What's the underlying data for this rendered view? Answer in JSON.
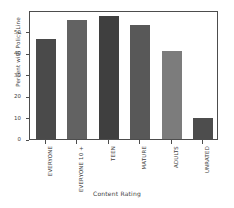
{
  "chart_data": {
    "type": "bar",
    "title": "",
    "xlabel": "Content Rating",
    "ylabel": "Percent with Policy Line",
    "categories": [
      "EVERYONE",
      "EVERYONE 10 +",
      "TEEN",
      "MATURE",
      "ADULTS",
      "UNRATED"
    ],
    "values": [
      46.5,
      55.5,
      57.0,
      53.0,
      41.0,
      9.8
    ],
    "bar_colors": [
      "#4a4a4a",
      "#626262",
      "#3f3f3f",
      "#585858",
      "#7c7c7c",
      "#4d4d4d"
    ],
    "ylim": [
      0,
      60
    ],
    "yticks": [
      0,
      10,
      20,
      30,
      40,
      50
    ],
    "ytick_labels": [
      "0",
      "10",
      "20",
      "30",
      "40",
      "50"
    ],
    "grid": false,
    "legend": null,
    "axis_color": "#4d4d4d",
    "background": "#ffffff"
  }
}
